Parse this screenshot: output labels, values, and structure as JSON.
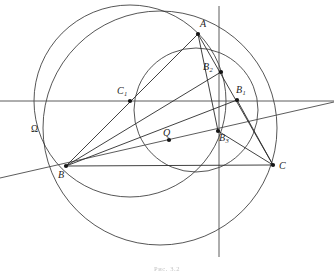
{
  "figure": {
    "caption": "Рис. 3.2",
    "background_color": "#ffffff",
    "ink_color": "#2b2b2b"
  },
  "points": [
    {
      "id": "A",
      "label": "A",
      "sub": "",
      "x": 198,
      "y": 34,
      "label_x": 200,
      "label_y": 19,
      "dot": true
    },
    {
      "id": "B",
      "label": "B",
      "sub": "",
      "x": 66,
      "y": 166,
      "label_x": 58,
      "label_y": 170,
      "dot": true
    },
    {
      "id": "C",
      "label": "C",
      "sub": "",
      "x": 273,
      "y": 165,
      "label_x": 279,
      "label_y": 161,
      "dot": true
    },
    {
      "id": "B1",
      "label": "B",
      "sub": "1",
      "x": 237,
      "y": 100,
      "label_x": 236,
      "label_y": 85,
      "dot": true
    },
    {
      "id": "B2",
      "label": "B",
      "sub": "2",
      "x": 221,
      "y": 72,
      "label_x": 203,
      "label_y": 62,
      "dot": true
    },
    {
      "id": "B3",
      "label": "B",
      "sub": "3",
      "x": 218,
      "y": 131,
      "label_x": 219,
      "label_y": 133,
      "dot": true
    },
    {
      "id": "C1",
      "label": "C",
      "sub": "1",
      "x": 130,
      "y": 101,
      "label_x": 117,
      "label_y": 86,
      "dot": true
    },
    {
      "id": "Q",
      "label": "Q",
      "sub": "",
      "x": 169,
      "y": 140,
      "label_x": 163,
      "label_y": 128,
      "dot": true
    },
    {
      "id": "Omega",
      "label": "Ω",
      "sub": "",
      "x": 36,
      "y": 132,
      "label_x": 31,
      "label_y": 125,
      "dot": false
    }
  ],
  "circles": [
    {
      "id": "big-circle",
      "cx": 160,
      "cy": 128,
      "r": 117
    },
    {
      "id": "medium-circle",
      "cx": 130,
      "cy": 101,
      "r": 96
    },
    {
      "id": "small-arc",
      "cx": 196,
      "cy": 110,
      "r": 62
    }
  ],
  "segments": [
    {
      "id": "seg-B-A",
      "x1": 66,
      "y1": 166,
      "x2": 198,
      "y2": 34
    },
    {
      "id": "seg-B-B2",
      "x1": 66,
      "y1": 166,
      "x2": 221,
      "y2": 72
    },
    {
      "id": "seg-B-B1",
      "x1": 66,
      "y1": 166,
      "x2": 237,
      "y2": 100
    },
    {
      "id": "seg-B-C",
      "x1": 66,
      "y1": 166,
      "x2": 273,
      "y2": 165
    },
    {
      "id": "seg-A-C",
      "x1": 198,
      "y1": 34,
      "x2": 273,
      "y2": 165
    },
    {
      "id": "seg-A-B3",
      "x1": 198,
      "y1": 34,
      "x2": 218,
      "y2": 131
    },
    {
      "id": "seg-B1-C",
      "x1": 237,
      "y1": 100,
      "x2": 273,
      "y2": 165
    },
    {
      "id": "seg-B3-C",
      "x1": 218,
      "y1": 131,
      "x2": 273,
      "y2": 165
    }
  ],
  "lines": [
    {
      "id": "horizontal-axis",
      "x1": 0,
      "y1": 101,
      "x2": 334,
      "y2": 101
    },
    {
      "id": "vertical-axis",
      "x1": 219,
      "y1": 6,
      "x2": 219,
      "y2": 257
    },
    {
      "id": "oblique-axis",
      "x1": 0,
      "y1": 178,
      "x2": 334,
      "y2": 102
    }
  ]
}
